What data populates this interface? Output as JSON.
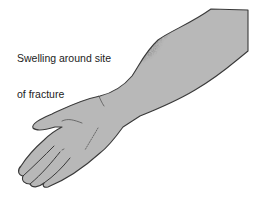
{
  "diagram": {
    "annotation": {
      "line1": "Swelling around site",
      "line2": "of fracture"
    },
    "colors": {
      "skin_fill": "#b8b8b8",
      "outline": "#3a3a3a",
      "swelling_shade": "#2a2a2a",
      "background": "#ffffff",
      "text": "#222222"
    }
  }
}
